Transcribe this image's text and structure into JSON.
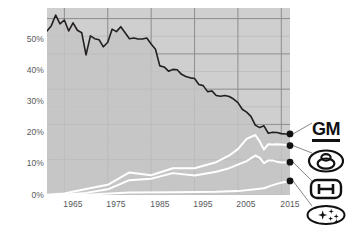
{
  "chart_data": {
    "type": "area",
    "title": "",
    "subtitle": "",
    "xlabel": "",
    "ylabel": "",
    "xlim": [
      1961,
      2017
    ],
    "ylim": [
      0,
      53
    ],
    "grid": true,
    "legend_position": "right",
    "y_ticks": [
      "0%",
      "10%",
      "20%",
      "30%",
      "40%",
      "50%"
    ],
    "y_tick_values": [
      0,
      10,
      20,
      30,
      40,
      50
    ],
    "x_ticks": [
      "1965",
      "1975",
      "1985",
      "1995",
      "2005",
      "2015"
    ],
    "x_tick_values": [
      1965,
      1975,
      1985,
      1995,
      2005,
      2015
    ],
    "colors": {
      "plot_background": "#cfcfcf",
      "area_fill": "#c4c4c4",
      "gm_line": "#231f20",
      "other_line": "#ffffff",
      "gridline_major": "#8d8d8d",
      "gridline_minor": "#bdbdbd",
      "tick_text": "#58595b",
      "endpoint_dot": "#111111"
    },
    "series": [
      {
        "name": "GM",
        "logo": "gm-logo",
        "style": "dark-line-with-fill",
        "end_value": 17.3,
        "x": [
          1961,
          1962,
          1963,
          1964,
          1965,
          1966,
          1967,
          1968,
          1969,
          1970,
          1971,
          1972,
          1973,
          1974,
          1975,
          1976,
          1977,
          1978,
          1979,
          1980,
          1981,
          1982,
          1983,
          1984,
          1985,
          1986,
          1987,
          1988,
          1989,
          1990,
          1991,
          1992,
          1993,
          1994,
          1995,
          1996,
          1997,
          1998,
          1999,
          2000,
          2001,
          2002,
          2003,
          2004,
          2005,
          2006,
          2007,
          2008,
          2009,
          2010,
          2011,
          2012,
          2013,
          2014,
          2015,
          2016,
          2017
        ],
        "values": [
          46.5,
          48.0,
          51.0,
          48.5,
          49.6,
          46.5,
          48.8,
          46.7,
          46.0,
          39.7,
          45.1,
          44.3,
          44.0,
          42.0,
          43.3,
          47.0,
          46.3,
          47.7,
          46.0,
          44.3,
          44.5,
          44.2,
          44.2,
          44.5,
          42.8,
          41.3,
          36.6,
          36.3,
          35.1,
          35.6,
          35.5,
          34.2,
          33.6,
          33.2,
          33.0,
          31.3,
          31.0,
          29.3,
          29.5,
          28.2,
          28.0,
          28.2,
          27.9,
          27.2,
          26.2,
          24.3,
          23.5,
          22.3,
          19.8,
          19.1,
          19.6,
          17.5,
          17.8,
          17.7,
          17.4,
          17.3,
          17.3
        ]
      },
      {
        "name": "Toyota",
        "logo": "toyota-logo",
        "style": "white-line",
        "end_value": 14.0,
        "x": [
          1961,
          1965,
          1970,
          1975,
          1980,
          1985,
          1990,
          1995,
          2000,
          2003,
          2005,
          2007,
          2009,
          2010,
          2011,
          2012,
          2013,
          2014,
          2015,
          2017
        ],
        "values": [
          0.1,
          0.4,
          1.7,
          2.9,
          6.4,
          5.6,
          7.6,
          7.6,
          9.3,
          11.2,
          13.0,
          15.9,
          17.0,
          15.2,
          12.9,
          14.4,
          14.3,
          14.4,
          14.3,
          14.0
        ]
      },
      {
        "name": "Honda",
        "logo": "honda-logo",
        "style": "white-line",
        "end_value": 9.3,
        "x": [
          1961,
          1965,
          1970,
          1975,
          1980,
          1985,
          1990,
          1995,
          2000,
          2003,
          2005,
          2007,
          2009,
          2010,
          2011,
          2012,
          2013,
          2014,
          2015,
          2017
        ],
        "values": [
          0.0,
          0.1,
          0.6,
          1.6,
          4.2,
          4.6,
          6.2,
          5.5,
          6.6,
          7.6,
          8.6,
          9.6,
          11.2,
          10.6,
          9.0,
          9.8,
          9.8,
          9.4,
          9.2,
          9.3
        ]
      },
      {
        "name": "Subaru",
        "logo": "subaru-logo",
        "style": "white-line",
        "end_value": 4.0,
        "x": [
          1961,
          1970,
          1980,
          1990,
          2000,
          2005,
          2009,
          2011,
          2013,
          2015,
          2017
        ],
        "values": [
          0.0,
          0.1,
          0.7,
          0.8,
          0.9,
          1.1,
          1.6,
          1.9,
          2.8,
          3.5,
          4.0
        ]
      }
    ]
  },
  "legend": {
    "items": [
      {
        "label": "GM",
        "icon": "gm-logo"
      },
      {
        "label": "Toyota",
        "icon": "toyota-logo"
      },
      {
        "label": "Honda",
        "icon": "honda-logo"
      },
      {
        "label": "Subaru",
        "icon": "subaru-logo"
      }
    ]
  }
}
